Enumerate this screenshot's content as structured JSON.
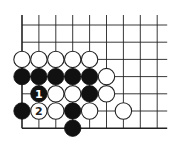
{
  "diagram": {
    "type": "go-board-fragment",
    "grid": {
      "columns": 9,
      "rows": 7,
      "origin_x": 22,
      "origin_y": 25,
      "spacing_x": 16.9,
      "spacing_y": 17.2,
      "top_extension": 10,
      "right_extension": 10,
      "left_edge": true,
      "bottom_edge": true,
      "line_color": "#222222",
      "edge_line_width": 1.6,
      "line_width": 0.9
    },
    "stone_radius": 8.2,
    "colors": {
      "black_fill": "#111111",
      "white_fill": "#ffffff",
      "white_stroke": "#222222",
      "label_on_black": "#ffffff",
      "label_on_white": "#222222"
    },
    "stones": [
      {
        "col": 0,
        "row": 2,
        "color": "white",
        "label": ""
      },
      {
        "col": 1,
        "row": 2,
        "color": "white",
        "label": ""
      },
      {
        "col": 2,
        "row": 2,
        "color": "white",
        "label": ""
      },
      {
        "col": 3,
        "row": 2,
        "color": "white",
        "label": ""
      },
      {
        "col": 4,
        "row": 2,
        "color": "white",
        "label": ""
      },
      {
        "col": 0,
        "row": 3,
        "color": "black",
        "label": ""
      },
      {
        "col": 1,
        "row": 3,
        "color": "black",
        "label": ""
      },
      {
        "col": 2,
        "row": 3,
        "color": "black",
        "label": ""
      },
      {
        "col": 3,
        "row": 3,
        "color": "black",
        "label": ""
      },
      {
        "col": 4,
        "row": 3,
        "color": "black",
        "label": ""
      },
      {
        "col": 5,
        "row": 3,
        "color": "white",
        "label": ""
      },
      {
        "col": 1,
        "row": 4,
        "color": "black",
        "label": "1"
      },
      {
        "col": 2,
        "row": 4,
        "color": "white",
        "label": ""
      },
      {
        "col": 3,
        "row": 4,
        "color": "white",
        "label": ""
      },
      {
        "col": 4,
        "row": 4,
        "color": "black",
        "label": ""
      },
      {
        "col": 5,
        "row": 4,
        "color": "white",
        "label": ""
      },
      {
        "col": 0,
        "row": 5,
        "color": "black",
        "label": ""
      },
      {
        "col": 1,
        "row": 5,
        "color": "white",
        "label": "2"
      },
      {
        "col": 2,
        "row": 5,
        "color": "white",
        "label": ""
      },
      {
        "col": 3,
        "row": 5,
        "color": "black",
        "label": ""
      },
      {
        "col": 4,
        "row": 5,
        "color": "white",
        "label": ""
      },
      {
        "col": 6,
        "row": 5,
        "color": "white",
        "label": ""
      },
      {
        "col": 3,
        "row": 6,
        "color": "black",
        "label": ""
      }
    ]
  }
}
